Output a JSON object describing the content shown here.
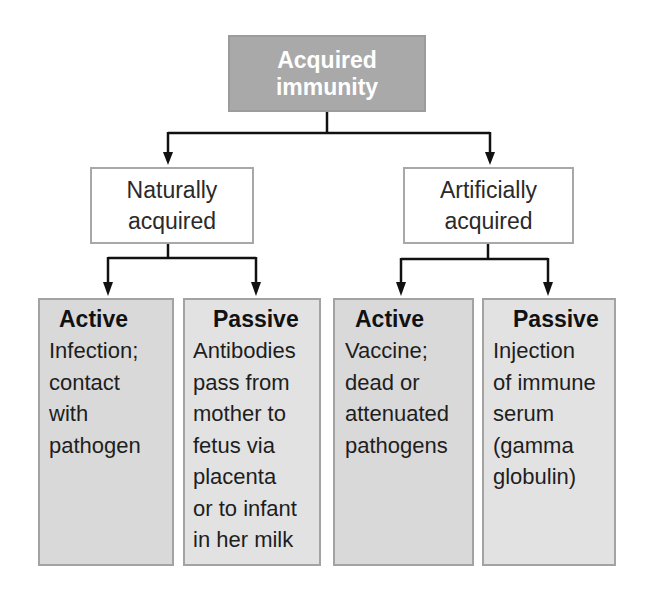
{
  "diagram": {
    "root": {
      "label": "Acquired immunity",
      "line1": "Acquired",
      "line2": "immunity",
      "color": "#a9a9a9"
    },
    "branches": [
      {
        "label": "Naturally acquired",
        "line1": "Naturally",
        "line2": "acquired",
        "children": [
          {
            "title": "Active",
            "description": "Infection;\ncontact\nwith\npathogen"
          },
          {
            "title": "Passive",
            "description": "Antibodies\npass from\nmother to\nfetus via\nplacenta\nor to infant\nin her milk"
          }
        ]
      },
      {
        "label": "Artificially acquired",
        "line1": "Artificially",
        "line2": "acquired",
        "children": [
          {
            "title": "Active",
            "description": "Vaccine;\ndead or\nattenuated\npathogens"
          },
          {
            "title": "Passive",
            "description": "Injection\nof immune\nserum\n(gamma\nglobulin)"
          }
        ]
      }
    ],
    "colors": {
      "root_fill": "#a9a9a9",
      "active_fill": "#d9d9d9",
      "passive_fill": "#e2e2e2",
      "arrow": "#111111"
    }
  }
}
